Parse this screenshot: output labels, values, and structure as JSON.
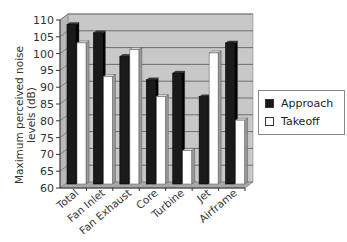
{
  "chart_data": {
    "type": "bar",
    "title": "",
    "xlabel": "",
    "ylabel": "Maximum perceived noise levels (dB)",
    "ylim": [
      60,
      110
    ],
    "yticks": [
      60,
      65,
      70,
      75,
      80,
      85,
      90,
      95,
      100,
      105,
      110
    ],
    "grid": true,
    "style": "3d-column",
    "legend_position": "right",
    "categories": [
      "Total",
      "Fan Inlet",
      "Fan Exhaust",
      "Core",
      "Turbine",
      "Jet",
      "Airframe"
    ],
    "series": [
      {
        "name": "Approach",
        "color": "#1a1a1a",
        "values": [
          107.5,
          105,
          98,
          91,
          93,
          86,
          102
        ]
      },
      {
        "name": "Takeoff",
        "color": "#ffffff",
        "values": [
          102,
          92,
          100,
          86,
          70,
          99,
          79
        ]
      }
    ]
  },
  "legend": {
    "items": [
      {
        "label": "Approach",
        "color": "#1a1a1a"
      },
      {
        "label": "Takeoff",
        "color": "#ffffff"
      }
    ]
  },
  "colors": {
    "wall": "#c8c8c8",
    "floor": "#a8a8a8",
    "grid": "#6e6e6e"
  }
}
